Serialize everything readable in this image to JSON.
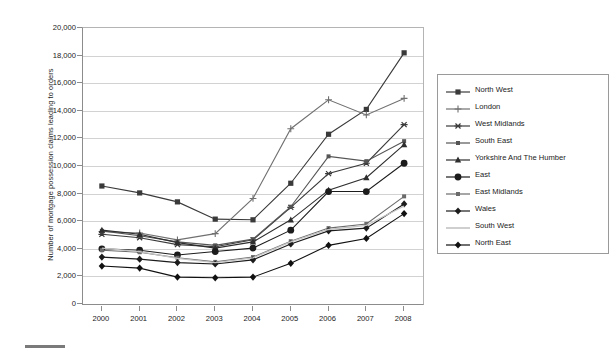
{
  "chart_data": {
    "type": "line",
    "title": "",
    "xlabel": "",
    "ylabel": "Number of mortgage possession claims leading to orders",
    "categories": [
      "2000",
      "2001",
      "2002",
      "2003",
      "2004",
      "2005",
      "2006",
      "2007",
      "2008"
    ],
    "x": [
      2000,
      2001,
      2002,
      2003,
      2004,
      2005,
      2006,
      2007,
      2008
    ],
    "ylim": [
      0,
      20000
    ],
    "ytick_labels": [
      "0",
      "2,000",
      "4,000",
      "6,000",
      "8,000",
      "10,000",
      "12,000",
      "14,000",
      "16,000",
      "18,000",
      "20,000"
    ],
    "ytick_values": [
      0,
      2000,
      4000,
      6000,
      8000,
      10000,
      12000,
      14000,
      16000,
      18000,
      20000
    ],
    "grid": true,
    "legend_position": "right",
    "series": [
      {
        "name": "North West",
        "marker": "square",
        "color": "#3a3a3a",
        "values": [
          8550,
          8050,
          7400,
          6150,
          6100,
          8750,
          12300,
          14100,
          18200
        ]
      },
      {
        "name": "London",
        "marker": "plus",
        "color": "#707070",
        "values": [
          5250,
          5150,
          4650,
          5100,
          7650,
          12700,
          14800,
          13700,
          14900
        ]
      },
      {
        "name": "West Midlands",
        "marker": "asterisk",
        "color": "#3a3a3a",
        "values": [
          5050,
          4800,
          4300,
          4150,
          4650,
          7000,
          9450,
          10200,
          13000
        ]
      },
      {
        "name": "South East",
        "marker": "small-square",
        "color": "#555555",
        "values": [
          5300,
          4950,
          4500,
          4250,
          4700,
          7050,
          10700,
          10350,
          11800
        ]
      },
      {
        "name": "Yorkshire And The Humber",
        "marker": "triangle",
        "color": "#2e2e2e",
        "values": [
          5350,
          5050,
          4450,
          4050,
          4500,
          6100,
          8250,
          9150,
          11550
        ]
      },
      {
        "name": "East",
        "marker": "circle",
        "color": "#1c1c1c",
        "values": [
          4000,
          3900,
          3550,
          3800,
          4050,
          5350,
          8150,
          8150,
          10200
        ]
      },
      {
        "name": "East Midlands",
        "marker": "small-square",
        "color": "#6b6b6b",
        "values": [
          3900,
          3750,
          3350,
          3050,
          3400,
          4550,
          5500,
          5800,
          7800
        ]
      },
      {
        "name": "Wales",
        "marker": "diamond",
        "color": "#1c1c1c",
        "values": [
          3400,
          3250,
          3000,
          2900,
          3200,
          4350,
          5300,
          5500,
          7250
        ]
      },
      {
        "name": "South West",
        "marker": "none",
        "color": "#c4c4c4",
        "values": [
          4050,
          3800,
          3300,
          3000,
          3350,
          4500,
          5400,
          5700,
          7100
        ]
      },
      {
        "name": "North East",
        "marker": "diamond",
        "color": "#111111",
        "values": [
          2750,
          2600,
          1950,
          1900,
          1950,
          2950,
          4250,
          4750,
          6550
        ]
      }
    ]
  },
  "axes": {
    "y_title": "Number of mortgage possession claims leading to orders"
  }
}
